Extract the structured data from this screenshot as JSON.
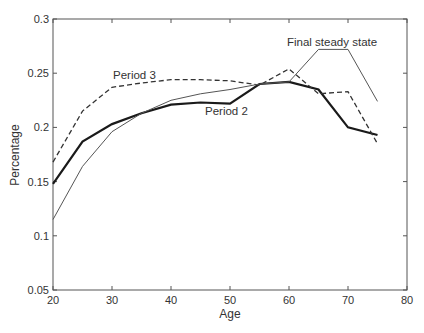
{
  "chart_data": {
    "type": "line",
    "title": "",
    "xlabel": "Age",
    "ylabel": "Percentage",
    "xlim": [
      20,
      80
    ],
    "ylim": [
      0.05,
      0.3
    ],
    "x_ticks": [
      20,
      30,
      40,
      50,
      60,
      70,
      80
    ],
    "y_ticks": [
      0.05,
      0.1,
      0.15,
      0.2,
      0.25,
      0.3
    ],
    "x_tick_labels": [
      "20",
      "30",
      "40",
      "50",
      "60",
      "70",
      "80"
    ],
    "y_tick_labels": [
      "0.05",
      "0.1",
      "0.15",
      "0.2",
      "0.25",
      "0.3"
    ],
    "grid": false,
    "legend": null,
    "x": [
      20,
      25,
      30,
      35,
      40,
      45,
      50,
      55,
      60,
      65,
      70,
      75
    ],
    "series": [
      {
        "name": "Period 2",
        "style": "solid-thick",
        "values": [
          0.148,
          0.187,
          0.203,
          0.213,
          0.221,
          0.223,
          0.222,
          0.24,
          0.242,
          0.235,
          0.2,
          0.193
        ]
      },
      {
        "name": "Period 3",
        "style": "dashed",
        "values": [
          0.168,
          0.215,
          0.237,
          0.241,
          0.244,
          0.244,
          0.243,
          0.239,
          0.254,
          0.231,
          0.233,
          0.185
        ]
      },
      {
        "name": "Final steady state",
        "style": "solid-thin",
        "values": [
          0.115,
          0.164,
          0.196,
          0.213,
          0.225,
          0.231,
          0.235,
          0.24,
          0.242,
          0.272,
          0.272,
          0.224
        ]
      }
    ],
    "annotations": [
      {
        "text": "Final steady state",
        "x": 287,
        "y": 46
      },
      {
        "text": "Period 3",
        "x": 113,
        "y": 79
      },
      {
        "text": "Period 2",
        "x": 205,
        "y": 115
      }
    ]
  },
  "labels": {
    "xlabel": "Age",
    "ylabel": "Percentage",
    "annot_final": "Final steady state",
    "annot_p3": "Period 3",
    "annot_p2": "Period 2"
  }
}
